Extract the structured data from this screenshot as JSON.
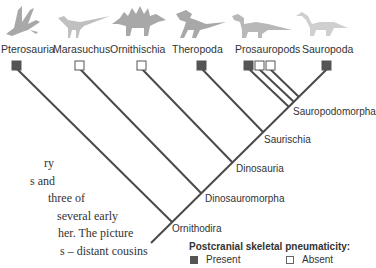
{
  "taxa": [
    {
      "name": "Pterosauria",
      "pneumaticity": "present"
    },
    {
      "name": "Marasuchus",
      "pneumaticity": "absent"
    },
    {
      "name": "Ornithischia",
      "pneumaticity": "absent"
    },
    {
      "name": "Theropoda",
      "pneumaticity": "present"
    },
    {
      "name": "Prosauropods",
      "pneumaticity": [
        "present",
        "absent",
        "absent"
      ]
    },
    {
      "name": "Sauropoda",
      "pneumaticity": "present"
    }
  ],
  "nodes": [
    {
      "name": "Sauropodomorpha"
    },
    {
      "name": "Saurischia"
    },
    {
      "name": "Dinosauria"
    },
    {
      "name": "Dinosauromorpha"
    },
    {
      "name": "Ornithodira"
    }
  ],
  "body_text": [
    "ry",
    "s and",
    " three of",
    "several early",
    "her. The picture",
    "s – distant cousins"
  ],
  "legend": {
    "title": "Postcranial skeletal pneumaticity:",
    "present": "Present",
    "absent": "Absent"
  },
  "colors": {
    "line": "#4a4a4a",
    "present_fill": "#555555",
    "absent_fill": "#ffffff",
    "silhouette": "#b0b0b0"
  },
  "icons": [
    "pterosaur-silhouette",
    "marasuchus-silhouette",
    "stegosaur-silhouette",
    "theropod-silhouette",
    "prosauropod-silhouette",
    "sauropod-silhouette"
  ]
}
